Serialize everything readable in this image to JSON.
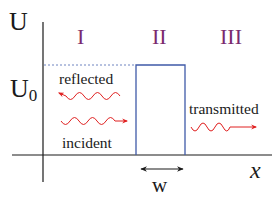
{
  "diagram": {
    "type": "potential-barrier",
    "axis": {
      "y_label": "U",
      "x_label": "x",
      "level_label": "U",
      "level_subscript": "0"
    },
    "regions": [
      {
        "label": "I"
      },
      {
        "label": "II"
      },
      {
        "label": "III"
      }
    ],
    "waves": {
      "reflected": "reflected",
      "incident": "incident",
      "transmitted": "transmitted"
    },
    "width_label": "w",
    "colors": {
      "axis": "#1a1a1a",
      "barrier": "#3f5aa8",
      "region_label": "#7a2a6e",
      "wave": "#e02020",
      "dashed": "#4a64b0",
      "text": "#1a1a1a"
    }
  }
}
